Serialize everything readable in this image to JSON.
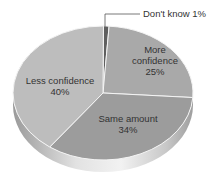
{
  "chart_data": {
    "type": "pie",
    "style": "3d",
    "title": "",
    "slices": [
      {
        "label": "Don't know",
        "value": 1,
        "display": "1%",
        "color": "#5f5f5f"
      },
      {
        "label": "More confidence",
        "value": 25,
        "display": "25%",
        "color": "#a9a9a9"
      },
      {
        "label": "Same amount",
        "value": 34,
        "display": "34%",
        "color": "#9c9c9c"
      },
      {
        "label": "Less confidence",
        "value": 40,
        "display": "40%",
        "color": "#bdbdbd"
      }
    ],
    "labels": {
      "dont_know": "Don't know  1%",
      "more_line1": "More",
      "more_line2": "confidence",
      "more_pct": "25%",
      "same_line1": "Same amount",
      "same_pct": "34%",
      "less_line1": "Less confidence",
      "less_pct": "40%"
    }
  }
}
